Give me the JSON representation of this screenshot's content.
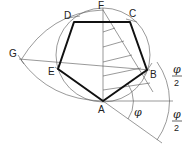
{
  "diagram": {
    "points": {
      "A": {
        "label": "A",
        "x": 103,
        "y": 101
      },
      "B": {
        "label": "B",
        "x": 147,
        "y": 70
      },
      "C": {
        "label": "C",
        "x": 130,
        "y": 22
      },
      "D": {
        "label": "D",
        "x": 74,
        "y": 22
      },
      "E": {
        "label": "E",
        "x": 58,
        "y": 69
      },
      "F": {
        "label": "F",
        "x": 103,
        "y": 10
      },
      "G": {
        "label": "G",
        "x": 21,
        "y": 60
      }
    },
    "angle_labels": {
      "phi": "φ",
      "half_phi_top_num": "φ",
      "half_phi_top_den": "2",
      "half_phi_bottom_num": "φ",
      "half_phi_bottom_den": "2"
    },
    "colors": {
      "construction": "#555555",
      "pentagon": "#111111",
      "text": "#222222"
    }
  }
}
